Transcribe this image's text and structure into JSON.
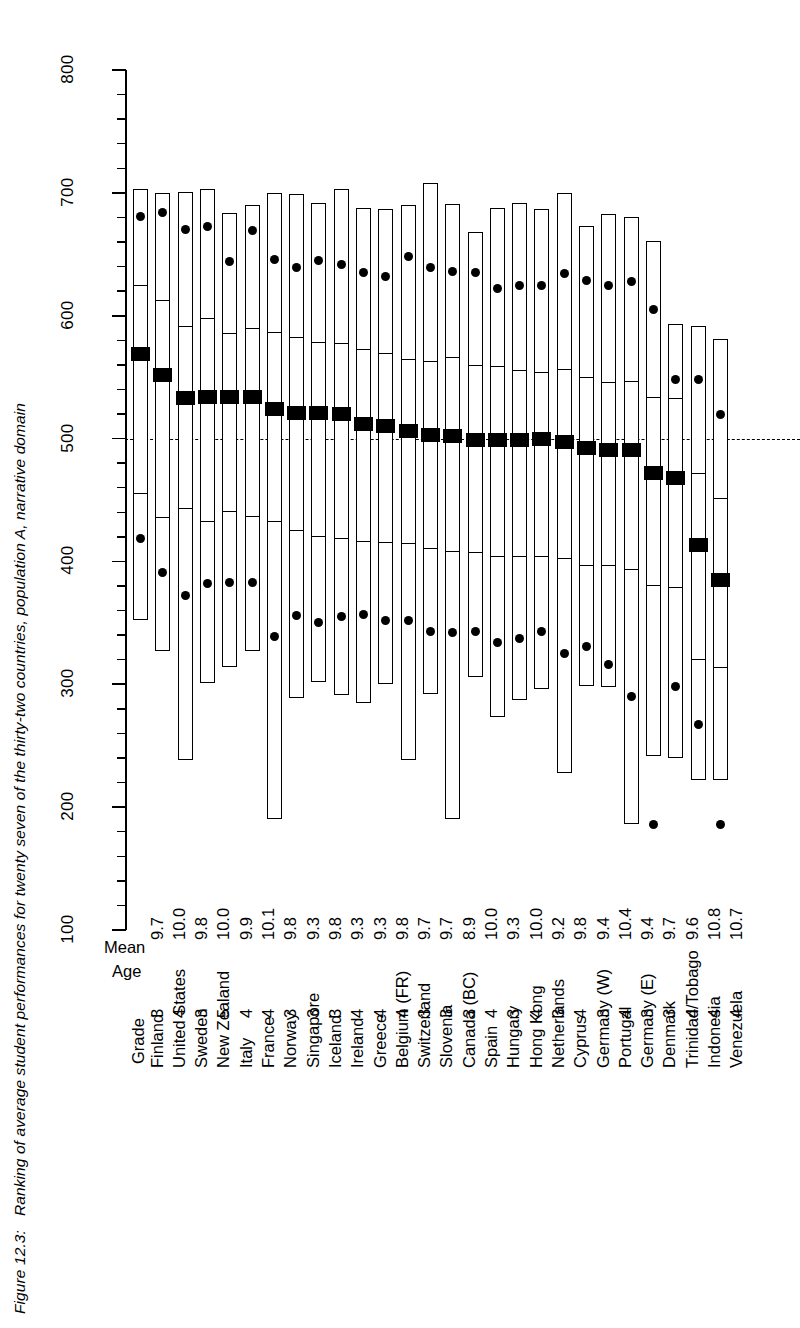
{
  "caption": {
    "figure_number": "Figure 12.3:",
    "text": "Ranking of average student performances for twenty seven of the thirty-two countries, population A, narrative domain"
  },
  "headers": {
    "mean": "Mean",
    "age": "Age",
    "grade": "Grade"
  },
  "axis": {
    "tick_labels": [
      "100",
      "200",
      "300",
      "400",
      "500",
      "600",
      "700",
      "800"
    ],
    "tick_values": [
      100,
      200,
      300,
      400,
      500,
      600,
      700,
      800
    ],
    "minor_step": 20,
    "reference_line_value": 500
  },
  "chart_data": {
    "type": "box",
    "title": "Ranking of average student performances for twenty seven of the thirty-two countries, population A, narrative domain",
    "xlabel": "",
    "ylabel": "",
    "ylim": [
      100,
      800
    ],
    "grid": false,
    "legend": "none",
    "reference_line": 500,
    "columns": [
      "Country",
      "Grade",
      "Mean Age",
      "p5",
      "p25",
      "mean",
      "p75",
      "p95",
      "low_dot",
      "high_dot"
    ],
    "note": "Each column is a box plot: outer rectangle spans p5-p95, inner lines mark p25 and p75, solid black block marks the mean, dots mark the 10th and 90th percentile marker points.",
    "categories": [
      "Finland",
      "United States",
      "Sweden",
      "New Zealand",
      "Italy",
      "France",
      "Norway",
      "Singapore",
      "Iceland",
      "Ireland",
      "Greece",
      "Belgium (FR)",
      "Switzerland",
      "Slovenia",
      "Canada (BC)",
      "Spain",
      "Hungary",
      "Hong Kong",
      "Netherlands",
      "Cyprus",
      "Germany (W)",
      "Portugal",
      "Germany (E)",
      "Denmark",
      "Trinidad/Tobago",
      "Indonesia",
      "Venezuela"
    ],
    "grade": [
      3,
      4,
      3,
      5,
      4,
      4,
      3,
      3,
      3,
      4,
      4,
      4,
      3,
      3,
      3,
      4,
      3,
      4,
      3,
      4,
      3,
      4,
      3,
      3,
      4,
      4,
      4
    ],
    "mean_age": [
      "9.7",
      "10.0",
      "9.8",
      "10.0",
      "9.9",
      "10.1",
      "9.8",
      "9.3",
      "9.8",
      "9.3",
      "9.3",
      "9.8",
      "9.7",
      "9.7",
      "8.9",
      "10.0",
      "9.3",
      "10.0",
      "9.2",
      "9.8",
      "9.4",
      "10.4",
      "9.4",
      "9.7",
      "9.6",
      "10.8",
      "10.7"
    ],
    "series": [
      {
        "name": "Finland",
        "p5": 352,
        "p25": 455,
        "mean": 569,
        "p75": 625,
        "p95": 703,
        "low_dot": 419,
        "high_dot": 681
      },
      {
        "name": "United States",
        "p5": 327,
        "p25": 435,
        "mean": 552,
        "p75": 613,
        "p95": 700,
        "low_dot": 391,
        "high_dot": 684
      },
      {
        "name": "Sweden",
        "p5": 238,
        "p25": 443,
        "mean": 533,
        "p75": 592,
        "p95": 701,
        "low_dot": 372,
        "high_dot": 670
      },
      {
        "name": "New Zealand",
        "p5": 301,
        "p25": 432,
        "mean": 534,
        "p75": 598,
        "p95": 703,
        "low_dot": 382,
        "high_dot": 673
      },
      {
        "name": "Italy",
        "p5": 314,
        "p25": 440,
        "mean": 534,
        "p75": 586,
        "p95": 684,
        "low_dot": 383,
        "high_dot": 644
      },
      {
        "name": "France",
        "p5": 327,
        "p25": 436,
        "mean": 534,
        "p75": 590,
        "p95": 690,
        "low_dot": 383,
        "high_dot": 669
      },
      {
        "name": "Norway",
        "p5": 190,
        "p25": 432,
        "mean": 524,
        "p75": 587,
        "p95": 700,
        "low_dot": 339,
        "high_dot": 646
      },
      {
        "name": "Singapore",
        "p5": 289,
        "p25": 425,
        "mean": 521,
        "p75": 583,
        "p95": 699,
        "low_dot": 356,
        "high_dot": 639
      },
      {
        "name": "Iceland",
        "p5": 302,
        "p25": 420,
        "mean": 521,
        "p75": 579,
        "p95": 692,
        "low_dot": 350,
        "high_dot": 645
      },
      {
        "name": "Ireland",
        "p5": 291,
        "p25": 418,
        "mean": 520,
        "p75": 578,
        "p95": 703,
        "low_dot": 355,
        "high_dot": 642
      },
      {
        "name": "Greece",
        "p5": 285,
        "p25": 416,
        "mean": 512,
        "p75": 573,
        "p95": 688,
        "low_dot": 357,
        "high_dot": 635
      },
      {
        "name": "Belgium (FR)",
        "p5": 300,
        "p25": 415,
        "mean": 510,
        "p75": 570,
        "p95": 687,
        "low_dot": 352,
        "high_dot": 632
      },
      {
        "name": "Switzerland",
        "p5": 238,
        "p25": 414,
        "mean": 506,
        "p75": 565,
        "p95": 690,
        "low_dot": 352,
        "high_dot": 648
      },
      {
        "name": "Slovenia",
        "p5": 292,
        "p25": 410,
        "mean": 503,
        "p75": 563,
        "p95": 708,
        "low_dot": 343,
        "high_dot": 639
      },
      {
        "name": "Canada (BC)",
        "p5": 190,
        "p25": 408,
        "mean": 502,
        "p75": 566,
        "p95": 691,
        "low_dot": 342,
        "high_dot": 636
      },
      {
        "name": "Spain",
        "p5": 306,
        "p25": 407,
        "mean": 499,
        "p75": 560,
        "p95": 668,
        "low_dot": 343,
        "high_dot": 635
      },
      {
        "name": "Hungary",
        "p5": 273,
        "p25": 404,
        "mean": 499,
        "p75": 559,
        "p95": 688,
        "low_dot": 334,
        "high_dot": 622
      },
      {
        "name": "Hong Kong",
        "p5": 287,
        "p25": 404,
        "mean": 499,
        "p75": 556,
        "p95": 692,
        "low_dot": 337,
        "high_dot": 625
      },
      {
        "name": "Netherlands",
        "p5": 296,
        "p25": 404,
        "mean": 500,
        "p75": 554,
        "p95": 687,
        "low_dot": 343,
        "high_dot": 625
      },
      {
        "name": "Cyprus",
        "p5": 228,
        "p25": 402,
        "mean": 497,
        "p75": 557,
        "p95": 700,
        "low_dot": 325,
        "high_dot": 634
      },
      {
        "name": "Germany (W)",
        "p5": 299,
        "p25": 396,
        "mean": 492,
        "p75": 550,
        "p95": 673,
        "low_dot": 331,
        "high_dot": 629
      },
      {
        "name": "Portugal",
        "p5": 298,
        "p25": 396,
        "mean": 491,
        "p75": 546,
        "p95": 683,
        "low_dot": 316,
        "high_dot": 625
      },
      {
        "name": "Germany (E)",
        "p5": 186,
        "p25": 393,
        "mean": 491,
        "p75": 547,
        "p95": 680,
        "low_dot": 290,
        "high_dot": 628
      },
      {
        "name": "Denmark",
        "p5": 242,
        "p25": 380,
        "mean": 472,
        "p75": 534,
        "p95": 661,
        "low_dot": 186,
        "high_dot": 605
      },
      {
        "name": "Trinidad/Tobago",
        "p5": 240,
        "p25": 378,
        "mean": 468,
        "p75": 533,
        "p95": 593,
        "low_dot": 298,
        "high_dot": 548
      },
      {
        "name": "Indonesia",
        "p5": 222,
        "p25": 320,
        "mean": 413,
        "p75": 472,
        "p95": 592,
        "low_dot": 267,
        "high_dot": 548
      },
      {
        "name": "Venezuela",
        "p5": 222,
        "p25": 313,
        "mean": 385,
        "p75": 452,
        "p95": 581,
        "low_dot": 186,
        "high_dot": 520
      }
    ]
  },
  "colors": {
    "ink": "#000000",
    "background": "#ffffff",
    "mean_marker": "#000000"
  }
}
